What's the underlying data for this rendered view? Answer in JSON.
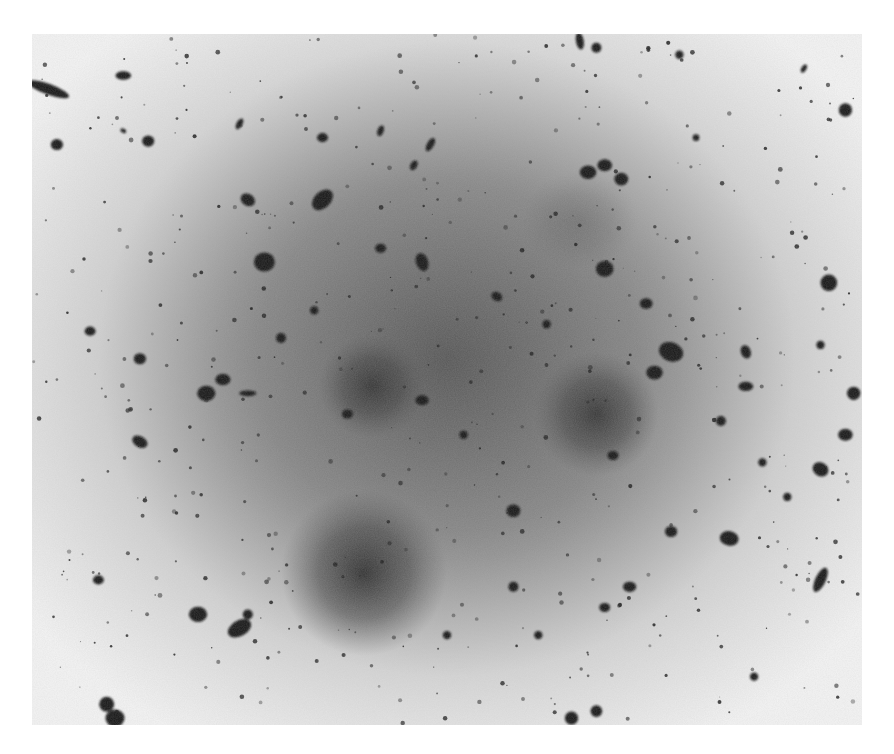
{
  "image": {
    "subject": "Negative astronomical photographic plate of a rich galaxy cluster",
    "rendering": "negative (objects dark on light background)",
    "colors": {
      "page": "#ffffff",
      "sky_edge": "#f2f2f2",
      "sky_mid": "#bdbdbd",
      "halo_core": "#3a3a3a",
      "object": "#141414"
    }
  },
  "halos": [
    {
      "name": "central-diffuse-glow",
      "cx": 0.5,
      "cy": 0.47,
      "rx": 0.42,
      "ry": 0.46,
      "strength": 0.55
    },
    {
      "name": "giant-elliptical-southwest",
      "cx": 0.4,
      "cy": 0.78,
      "rx": 0.1,
      "ry": 0.12,
      "strength": 0.85
    },
    {
      "name": "giant-elliptical-west",
      "cx": 0.41,
      "cy": 0.51,
      "rx": 0.065,
      "ry": 0.075,
      "strength": 0.7
    },
    {
      "name": "giant-elliptical-east",
      "cx": 0.68,
      "cy": 0.55,
      "rx": 0.075,
      "ry": 0.09,
      "strength": 0.75
    },
    {
      "name": "faint-shell-northeast",
      "cx": 0.66,
      "cy": 0.27,
      "rx": 0.07,
      "ry": 0.07,
      "strength": 0.2
    }
  ],
  "objects": [
    {
      "x": 0.11,
      "y": 0.06,
      "r": 0.007,
      "e": 1.8,
      "a": 0
    },
    {
      "x": 0.02,
      "y": 0.08,
      "r": 0.013,
      "e": 4.0,
      "a": 20
    },
    {
      "x": 0.03,
      "y": 0.16,
      "r": 0.007,
      "e": 1.1,
      "a": 0
    },
    {
      "x": 0.14,
      "y": 0.155,
      "r": 0.007,
      "e": 1.1,
      "a": 0
    },
    {
      "x": 0.11,
      "y": 0.14,
      "r": 0.003,
      "e": 1.5,
      "a": 30
    },
    {
      "x": 0.25,
      "y": 0.13,
      "r": 0.005,
      "e": 2.0,
      "a": -60
    },
    {
      "x": 0.35,
      "y": 0.15,
      "r": 0.006,
      "e": 1.2,
      "a": 0
    },
    {
      "x": 0.42,
      "y": 0.14,
      "r": 0.005,
      "e": 1.8,
      "a": -70
    },
    {
      "x": 0.48,
      "y": 0.16,
      "r": 0.006,
      "e": 2.2,
      "a": -60
    },
    {
      "x": 0.46,
      "y": 0.19,
      "r": 0.005,
      "e": 1.6,
      "a": -60
    },
    {
      "x": 0.35,
      "y": 0.24,
      "r": 0.012,
      "e": 1.5,
      "a": -45
    },
    {
      "x": 0.26,
      "y": 0.24,
      "r": 0.008,
      "e": 1.3,
      "a": 30
    },
    {
      "x": 0.28,
      "y": 0.33,
      "r": 0.012,
      "e": 1.1,
      "a": 0
    },
    {
      "x": 0.42,
      "y": 0.31,
      "r": 0.006,
      "e": 1.2,
      "a": 0
    },
    {
      "x": 0.47,
      "y": 0.33,
      "r": 0.009,
      "e": 1.5,
      "a": 70
    },
    {
      "x": 0.67,
      "y": 0.2,
      "r": 0.009,
      "e": 1.2,
      "a": 0
    },
    {
      "x": 0.69,
      "y": 0.19,
      "r": 0.008,
      "e": 1.2,
      "a": 0
    },
    {
      "x": 0.71,
      "y": 0.21,
      "r": 0.008,
      "e": 1.1,
      "a": 0
    },
    {
      "x": 0.69,
      "y": 0.34,
      "r": 0.01,
      "e": 1.1,
      "a": 0
    },
    {
      "x": 0.74,
      "y": 0.39,
      "r": 0.007,
      "e": 1.2,
      "a": 0
    },
    {
      "x": 0.77,
      "y": 0.46,
      "r": 0.013,
      "e": 1.3,
      "a": 20
    },
    {
      "x": 0.75,
      "y": 0.49,
      "r": 0.009,
      "e": 1.2,
      "a": 0
    },
    {
      "x": 0.86,
      "y": 0.46,
      "r": 0.007,
      "e": 1.4,
      "a": 70
    },
    {
      "x": 0.86,
      "y": 0.51,
      "r": 0.007,
      "e": 1.6,
      "a": 0
    },
    {
      "x": 0.96,
      "y": 0.36,
      "r": 0.01,
      "e": 1.0,
      "a": 0
    },
    {
      "x": 0.95,
      "y": 0.45,
      "r": 0.005,
      "e": 1.0,
      "a": 0
    },
    {
      "x": 0.99,
      "y": 0.52,
      "r": 0.008,
      "e": 1.0,
      "a": 0
    },
    {
      "x": 0.98,
      "y": 0.58,
      "r": 0.008,
      "e": 1.2,
      "a": 0
    },
    {
      "x": 0.95,
      "y": 0.63,
      "r": 0.009,
      "e": 1.2,
      "a": 30
    },
    {
      "x": 0.84,
      "y": 0.73,
      "r": 0.01,
      "e": 1.3,
      "a": 10
    },
    {
      "x": 0.95,
      "y": 0.79,
      "r": 0.01,
      "e": 2.5,
      "a": -65
    },
    {
      "x": 0.88,
      "y": 0.62,
      "r": 0.005,
      "e": 1.0,
      "a": 0
    },
    {
      "x": 0.13,
      "y": 0.59,
      "r": 0.008,
      "e": 1.5,
      "a": 30
    },
    {
      "x": 0.07,
      "y": 0.43,
      "r": 0.006,
      "e": 1.2,
      "a": 0
    },
    {
      "x": 0.13,
      "y": 0.47,
      "r": 0.007,
      "e": 1.1,
      "a": 0
    },
    {
      "x": 0.21,
      "y": 0.52,
      "r": 0.01,
      "e": 1.2,
      "a": 0
    },
    {
      "x": 0.23,
      "y": 0.5,
      "r": 0.008,
      "e": 1.3,
      "a": 0
    },
    {
      "x": 0.26,
      "y": 0.52,
      "r": 0.006,
      "e": 3.0,
      "a": 0
    },
    {
      "x": 0.38,
      "y": 0.55,
      "r": 0.006,
      "e": 1.2,
      "a": 0
    },
    {
      "x": 0.47,
      "y": 0.53,
      "r": 0.007,
      "e": 1.3,
      "a": 0
    },
    {
      "x": 0.58,
      "y": 0.69,
      "r": 0.008,
      "e": 1.1,
      "a": 0
    },
    {
      "x": 0.7,
      "y": 0.61,
      "r": 0.006,
      "e": 1.2,
      "a": 0
    },
    {
      "x": 0.2,
      "y": 0.84,
      "r": 0.01,
      "e": 1.2,
      "a": 0
    },
    {
      "x": 0.25,
      "y": 0.86,
      "r": 0.012,
      "e": 1.6,
      "a": -30
    },
    {
      "x": 0.26,
      "y": 0.84,
      "r": 0.006,
      "e": 1.0,
      "a": 0
    },
    {
      "x": 0.09,
      "y": 0.97,
      "r": 0.009,
      "e": 1.0,
      "a": 0
    },
    {
      "x": 0.1,
      "y": 0.99,
      "r": 0.011,
      "e": 1.1,
      "a": 0
    },
    {
      "x": 0.08,
      "y": 0.79,
      "r": 0.006,
      "e": 1.2,
      "a": 0
    },
    {
      "x": 0.77,
      "y": 0.72,
      "r": 0.007,
      "e": 1.1,
      "a": 0
    },
    {
      "x": 0.72,
      "y": 0.8,
      "r": 0.007,
      "e": 1.3,
      "a": 0
    },
    {
      "x": 0.69,
      "y": 0.83,
      "r": 0.006,
      "e": 1.2,
      "a": 0
    },
    {
      "x": 0.61,
      "y": 0.87,
      "r": 0.005,
      "e": 1.0,
      "a": 0
    },
    {
      "x": 0.65,
      "y": 0.99,
      "r": 0.008,
      "e": 1.0,
      "a": 0
    },
    {
      "x": 0.68,
      "y": 0.98,
      "r": 0.007,
      "e": 1.0,
      "a": 0
    },
    {
      "x": 0.87,
      "y": 0.93,
      "r": 0.005,
      "e": 1.0,
      "a": 0
    },
    {
      "x": 0.98,
      "y": 0.11,
      "r": 0.008,
      "e": 1.0,
      "a": 0
    },
    {
      "x": 0.93,
      "y": 0.05,
      "r": 0.004,
      "e": 1.8,
      "a": -60
    },
    {
      "x": 0.68,
      "y": 0.02,
      "r": 0.006,
      "e": 1.0,
      "a": 0
    },
    {
      "x": 0.66,
      "y": 0.01,
      "r": 0.007,
      "e": 2.2,
      "a": 80
    },
    {
      "x": 0.78,
      "y": 0.03,
      "r": 0.005,
      "e": 1.0,
      "a": 0
    },
    {
      "x": 0.8,
      "y": 0.15,
      "r": 0.004,
      "e": 1.0,
      "a": 0
    },
    {
      "x": 0.91,
      "y": 0.67,
      "r": 0.005,
      "e": 1.0,
      "a": 0
    },
    {
      "x": 0.52,
      "y": 0.58,
      "r": 0.005,
      "e": 1.0,
      "a": 0
    },
    {
      "x": 0.3,
      "y": 0.44,
      "r": 0.006,
      "e": 1.0,
      "a": 0
    },
    {
      "x": 0.34,
      "y": 0.4,
      "r": 0.005,
      "e": 1.0,
      "a": 0
    },
    {
      "x": 0.56,
      "y": 0.38,
      "r": 0.006,
      "e": 1.3,
      "a": 30
    },
    {
      "x": 0.62,
      "y": 0.42,
      "r": 0.005,
      "e": 1.0,
      "a": 0
    },
    {
      "x": 0.83,
      "y": 0.56,
      "r": 0.006,
      "e": 1.0,
      "a": 0
    },
    {
      "x": 0.5,
      "y": 0.87,
      "r": 0.005,
      "e": 1.0,
      "a": 0
    },
    {
      "x": 0.58,
      "y": 0.8,
      "r": 0.006,
      "e": 1.0,
      "a": 0
    }
  ],
  "faint_count": 520
}
